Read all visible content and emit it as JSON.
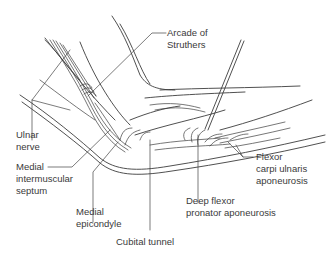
{
  "figure": {
    "type": "anatomical line drawing",
    "background": "#ffffff",
    "line_color": "#3c3c3c",
    "text_color": "#3a3a3a"
  },
  "labels": {
    "arcade_of_struthers": "Arcade of\nStruthers",
    "ulnar_nerve": "Ulnar\nnerve",
    "medial_intermuscular_septum": "Medial\nintermuscular\nseptum",
    "medial_epicondyle": "Medial\nepicondyle",
    "cubital_tunnel": "Cubital tunnel",
    "flexor_carpi_ulnaris_aponeurosis": "Flexor\ncarpi ulnaris\naponeurosis",
    "deep_flexor_pronator_aponeurosis": "Deep flexor\npronator aponeurosis"
  }
}
